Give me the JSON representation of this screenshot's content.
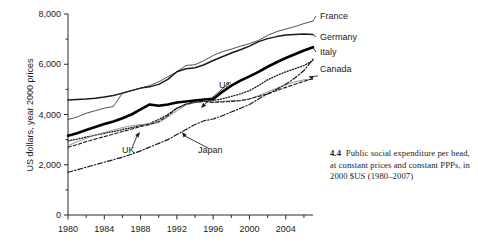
{
  "figure": {
    "caption_number": "4.4",
    "caption_text": "Public social expenditure per head, at constant prices and constant PPPs, in 2000 $US (1980–2007)"
  },
  "chart_data": {
    "type": "line",
    "title": "",
    "xlabel": "",
    "ylabel": "US dollars, year 2000 prices",
    "xlim": [
      1980,
      2007
    ],
    "ylim": [
      0,
      8000
    ],
    "grid": false,
    "legend_position": "right-of-plot-line-ends",
    "x_tick_labels": [
      "1980",
      "1984",
      "1988",
      "1992",
      "1996",
      "2000",
      "2004"
    ],
    "x_major_ticks": [
      1980,
      1984,
      1988,
      1992,
      1996,
      2000,
      2004
    ],
    "x_minor_ticks": [
      1982,
      1986,
      1990,
      1994,
      1998,
      2002,
      2006
    ],
    "y_tick_labels": [
      "0",
      "2,000",
      "4,000",
      "6,000",
      "8,000"
    ],
    "y_major_ticks": [
      0,
      2000,
      4000,
      6000,
      8000
    ],
    "y_minor_ticks": [
      1000,
      3000,
      5000,
      7000
    ],
    "x": [
      1980,
      1981,
      1982,
      1983,
      1984,
      1985,
      1986,
      1987,
      1988,
      1989,
      1990,
      1991,
      1992,
      1993,
      1994,
      1995,
      1996,
      1997,
      1998,
      1999,
      2000,
      2001,
      2002,
      2003,
      2004,
      2005,
      2006,
      2007
    ],
    "series": [
      {
        "name": "France",
        "label": "France",
        "label_kind": "right-end",
        "style": "solid-thin-gray",
        "values": [
          3800,
          3900,
          4050,
          4150,
          4250,
          4320,
          4850,
          4950,
          5050,
          5150,
          5300,
          5500,
          5700,
          5950,
          5980,
          6150,
          6350,
          6500,
          6600,
          6720,
          6820,
          6950,
          7150,
          7300,
          7400,
          7500,
          7620,
          7720
        ]
      },
      {
        "name": "Germany",
        "label": "Germany",
        "label_kind": "right-end",
        "style": "solid-medium-dark",
        "values": [
          4580,
          4600,
          4620,
          4650,
          4700,
          4760,
          4850,
          4950,
          5050,
          5100,
          5200,
          5400,
          5700,
          5820,
          5860,
          5980,
          6150,
          6300,
          6450,
          6580,
          6720,
          6900,
          7020,
          7100,
          7160,
          7180,
          7200,
          7180
        ]
      },
      {
        "name": "Italy",
        "label": "Italy",
        "label_kind": "right-end",
        "style": "solid-thick-black",
        "values": [
          3150,
          3250,
          3380,
          3500,
          3620,
          3720,
          3850,
          4000,
          4200,
          4400,
          4350,
          4400,
          4480,
          4520,
          4560,
          4600,
          4620,
          4900,
          5150,
          5350,
          5520,
          5700,
          5900,
          6080,
          6250,
          6400,
          6550,
          6680
        ]
      },
      {
        "name": "US",
        "label": "US",
        "label_kind": "in-plot-arrow",
        "style": "dotted",
        "values": [
          2950,
          3020,
          3100,
          3180,
          3250,
          3320,
          3400,
          3480,
          3560,
          3640,
          3800,
          4000,
          4250,
          4400,
          4480,
          4520,
          4560,
          4620,
          4720,
          4820,
          4950,
          5150,
          5380,
          5550,
          5700,
          5820,
          5950,
          6150
        ]
      },
      {
        "name": "UK",
        "label": "UK",
        "label_kind": "in-plot-arrow",
        "style": "solid-thin-lightgray",
        "values": [
          2750,
          2920,
          3050,
          3180,
          3280,
          3380,
          3480,
          3550,
          3600,
          3620,
          3680,
          3900,
          4150,
          4380,
          4480,
          4520,
          4500,
          4520,
          4550,
          4560,
          4620,
          4750,
          4900,
          5050,
          5180,
          5300,
          5380,
          5420
        ]
      },
      {
        "name": "Canada",
        "label": "Canada",
        "label_kind": "right-end-arrow",
        "style": "dashed",
        "values": [
          2700,
          2800,
          2920,
          3020,
          3120,
          3220,
          3320,
          3420,
          3520,
          3600,
          3720,
          3950,
          4250,
          4420,
          4500,
          4520,
          4480,
          4500,
          4520,
          4550,
          4620,
          4720,
          4820,
          4950,
          5080,
          5200,
          5320,
          5420
        ]
      },
      {
        "name": "Japan",
        "label": "Japan",
        "label_kind": "in-plot-arrow",
        "style": "dash-dot",
        "values": [
          1700,
          1800,
          1900,
          2000,
          2100,
          2200,
          2300,
          2420,
          2550,
          2700,
          2850,
          3000,
          3200,
          3400,
          3600,
          3750,
          3820,
          3950,
          4100,
          4250,
          4400,
          4620,
          4820,
          5000,
          5200,
          5450,
          5750,
          6200
        ]
      }
    ],
    "annotations": [
      {
        "text": "US",
        "target_series": "US"
      },
      {
        "text": "UK",
        "target_series": "UK"
      },
      {
        "text": "Japan",
        "target_series": "Japan"
      },
      {
        "text": "Canada",
        "target_series": "Canada"
      }
    ]
  }
}
